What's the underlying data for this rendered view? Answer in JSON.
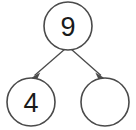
{
  "diagram": {
    "type": "number-bond-tree",
    "background_color": "#ffffff",
    "stroke_color": "#4a4a4a",
    "text_color": "#1a1a1a",
    "nodes": [
      {
        "id": "root",
        "role": "total",
        "label": "9",
        "cx": 68,
        "cy": 26,
        "r": 24,
        "filled": true
      },
      {
        "id": "left",
        "role": "part",
        "label": "4",
        "cx": 31,
        "cy": 102,
        "r": 24,
        "filled": true
      },
      {
        "id": "right",
        "role": "part",
        "label": "",
        "cx": 105,
        "cy": 102,
        "r": 24,
        "filled": false
      }
    ],
    "edges": [
      {
        "id": "edge-root-left",
        "from": "root",
        "to": "left",
        "x1": 65,
        "y1": 49,
        "x2": 33,
        "y2": 76,
        "arrow": "end"
      },
      {
        "id": "edge-root-right",
        "from": "root",
        "to": "right",
        "x1": 71,
        "y1": 49,
        "x2": 102,
        "y2": 76,
        "arrow": "end"
      }
    ]
  }
}
